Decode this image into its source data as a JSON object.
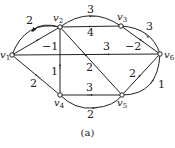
{
  "diagram": {
    "type": "directed-weighted-graph",
    "caption": "(a)",
    "nodes": [
      {
        "id": "v1",
        "label": "v",
        "sub": "1",
        "x": 12,
        "y": 55
      },
      {
        "id": "v2",
        "label": "v",
        "sub": "2",
        "x": 60,
        "y": 27
      },
      {
        "id": "v3",
        "label": "v",
        "sub": "3",
        "x": 121,
        "y": 26
      },
      {
        "id": "v4",
        "label": "v",
        "sub": "4",
        "x": 60,
        "y": 95
      },
      {
        "id": "v5",
        "label": "v",
        "sub": "5",
        "x": 122,
        "y": 95
      },
      {
        "id": "v6",
        "label": "v",
        "sub": "6",
        "x": 160,
        "y": 54
      }
    ],
    "edges": [
      {
        "from": "v2",
        "to": "v1",
        "weight": "2",
        "shape": "arc-upper"
      },
      {
        "from": "v2",
        "to": "v1",
        "weight": "−1",
        "shape": "straight"
      },
      {
        "from": "v1",
        "to": "v6",
        "weight": "3",
        "shape": "straight"
      },
      {
        "from": "v4",
        "to": "v1",
        "weight": "2",
        "shape": "straight"
      },
      {
        "from": "v3",
        "to": "v2",
        "weight": "3",
        "shape": "arc-upper"
      },
      {
        "from": "v3",
        "to": "v2",
        "weight": "4",
        "shape": "straight"
      },
      {
        "from": "v4",
        "to": "v2",
        "weight": "1",
        "shape": "straight"
      },
      {
        "from": "v2",
        "to": "v5",
        "weight": "2",
        "shape": "straight"
      },
      {
        "from": "v3",
        "to": "v6",
        "weight": "3",
        "shape": "arc-upper"
      },
      {
        "from": "v6",
        "to": "v3",
        "weight": "−2",
        "shape": "straight"
      },
      {
        "from": "v5",
        "to": "v6",
        "weight": "2",
        "shape": "straight"
      },
      {
        "from": "v5",
        "to": "v6",
        "weight": "1",
        "shape": "arc-lower"
      },
      {
        "from": "v4",
        "to": "v5",
        "weight": "3",
        "shape": "straight"
      },
      {
        "from": "v5",
        "to": "v4",
        "weight": "2",
        "shape": "arc-lower"
      }
    ],
    "weight_labels": {
      "e_v2_v1_arc": "2",
      "e_v2_v1": "−1",
      "e_v1_v6": "3",
      "e_v4_v1": "2",
      "e_v3_v2_arc": "3",
      "e_v3_v2": "4",
      "e_v4_v2": "1",
      "e_v2_v5": "2",
      "e_v3_v6_arc": "3",
      "e_v6_v3": "−2",
      "e_v5_v6": "2",
      "e_v5_v6_arc": "1",
      "e_v4_v5": "3",
      "e_v5_v4_arc": "2"
    },
    "node_labels": {
      "v1": "v",
      "v2": "v",
      "v3": "v",
      "v4": "v",
      "v5": "v",
      "v6": "v"
    },
    "node_subs": {
      "v1": "1",
      "v2": "2",
      "v3": "3",
      "v4": "4",
      "v5": "5",
      "v6": "6"
    }
  }
}
